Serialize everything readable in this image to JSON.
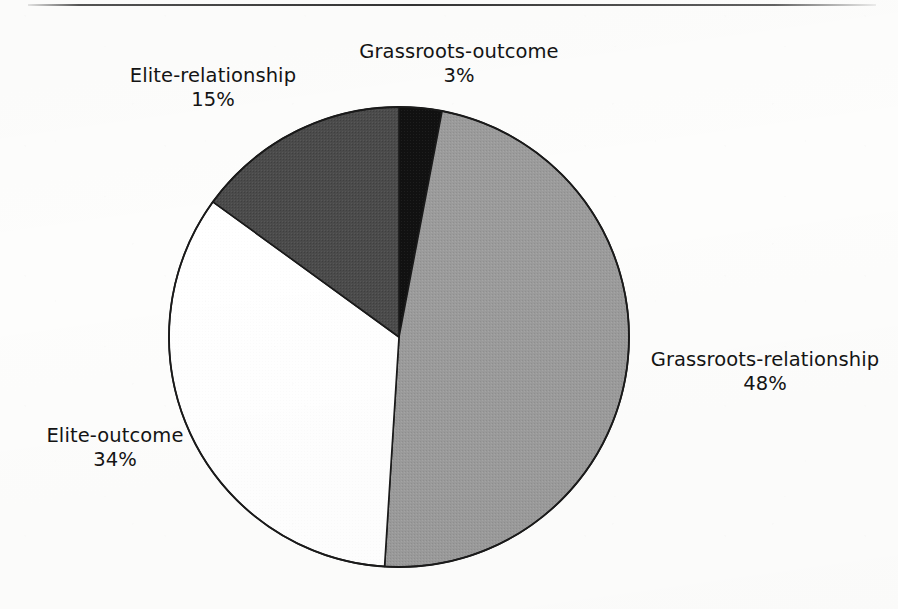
{
  "page": {
    "background_color": "#fdfdfc",
    "top_rule_color": "#3a3a3a"
  },
  "chart_data": {
    "type": "pie",
    "title": "",
    "subtitle": "",
    "xlabel": "",
    "ylabel": "",
    "legend_position": "none",
    "labels_position": "outside-callout",
    "start_angle_deg": 0,
    "direction": "clockwise",
    "units": "percent",
    "categories": [
      "Grassroots-outcome",
      "Grassroots-relationship",
      "Elite-outcome",
      "Elite-relationship"
    ],
    "values": [
      3,
      48,
      34,
      15
    ],
    "slices": [
      {
        "name": "Grassroots-outcome",
        "value": 3,
        "value_label": "3%",
        "color": "#111111",
        "stroke": "#1a1a1a",
        "start_deg": 0.0,
        "end_deg": 10.8
      },
      {
        "name": "Grassroots-relationship",
        "value": 48,
        "value_label": "48%",
        "color": "#9b9b9b",
        "stroke": "#1a1a1a",
        "start_deg": 10.8,
        "end_deg": 183.6
      },
      {
        "name": "Elite-outcome",
        "value": 34,
        "value_label": "34%",
        "color": "#ffffff",
        "stroke": "#1a1a1a",
        "start_deg": 183.6,
        "end_deg": 306.0
      },
      {
        "name": "Elite-relationship",
        "value": 15,
        "value_label": "15%",
        "color": "#4b4b4b",
        "stroke": "#1a1a1a",
        "start_deg": 306.0,
        "end_deg": 360.0
      }
    ],
    "geometry": {
      "center_x": 399,
      "center_y": 337,
      "radius": 230
    }
  },
  "labels": {
    "grassroots_outcome": {
      "name": "Grassroots-outcome",
      "value": "3%"
    },
    "grassroots_relationship": {
      "name": "Grassroots-relationship",
      "value": "48%"
    },
    "elite_outcome": {
      "name": "Elite-outcome",
      "value": "34%"
    },
    "elite_relationship": {
      "name": "Elite-relationship",
      "value": "15%"
    }
  }
}
